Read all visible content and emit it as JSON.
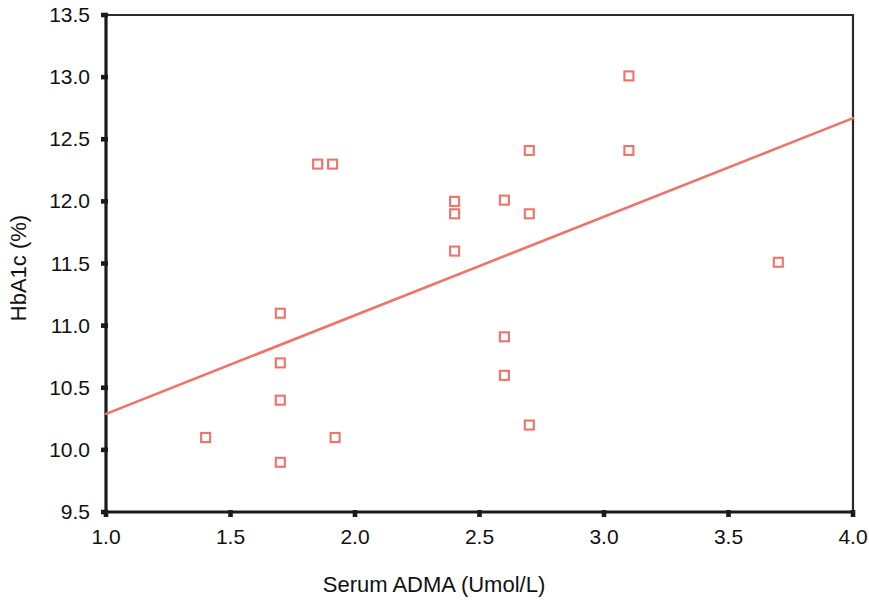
{
  "chart_data": {
    "type": "scatter",
    "title": "",
    "xlabel": "Serum ADMA (Umol/L)",
    "ylabel": "HbA1c (%)",
    "xlim": [
      1.0,
      4.0
    ],
    "ylim": [
      9.5,
      13.5
    ],
    "xticks": [
      1.0,
      1.5,
      2.0,
      2.5,
      3.0,
      3.5,
      4.0
    ],
    "yticks": [
      9.5,
      10.0,
      10.5,
      11.0,
      11.5,
      12.0,
      12.5,
      13.0,
      13.5
    ],
    "xtick_labels": [
      "1.0",
      "1.5",
      "2.0",
      "2.5",
      "3.0",
      "3.5",
      "4.0"
    ],
    "ytick_labels": [
      "9.5",
      "10.0",
      "10.5",
      "11.0",
      "11.5",
      "12.0",
      "12.5",
      "13.0",
      "13.5"
    ],
    "grid": false,
    "legend": null,
    "marker": "open-square",
    "marker_color": "#f0736a",
    "axis_color": "#1b1b1b",
    "points": [
      {
        "x": 1.4,
        "y": 10.1
      },
      {
        "x": 1.7,
        "y": 11.1
      },
      {
        "x": 1.7,
        "y": 10.7
      },
      {
        "x": 1.7,
        "y": 10.4
      },
      {
        "x": 1.7,
        "y": 9.9
      },
      {
        "x": 1.85,
        "y": 12.3
      },
      {
        "x": 1.91,
        "y": 12.3
      },
      {
        "x": 1.92,
        "y": 10.1
      },
      {
        "x": 2.4,
        "y": 12.0
      },
      {
        "x": 2.4,
        "y": 11.9
      },
      {
        "x": 2.4,
        "y": 11.6
      },
      {
        "x": 2.6,
        "y": 12.01
      },
      {
        "x": 2.6,
        "y": 10.91
      },
      {
        "x": 2.6,
        "y": 10.6
      },
      {
        "x": 2.7,
        "y": 12.41
      },
      {
        "x": 2.7,
        "y": 11.9
      },
      {
        "x": 2.7,
        "y": 10.2
      },
      {
        "x": 3.1,
        "y": 13.01
      },
      {
        "x": 3.1,
        "y": 12.41
      },
      {
        "x": 3.7,
        "y": 11.51
      }
    ],
    "trend_line": {
      "type": "linear-fit",
      "color": "#f0736a",
      "x_start": 1.0,
      "y_start": 10.29,
      "x_end": 4.0,
      "y_end": 12.67
    }
  }
}
